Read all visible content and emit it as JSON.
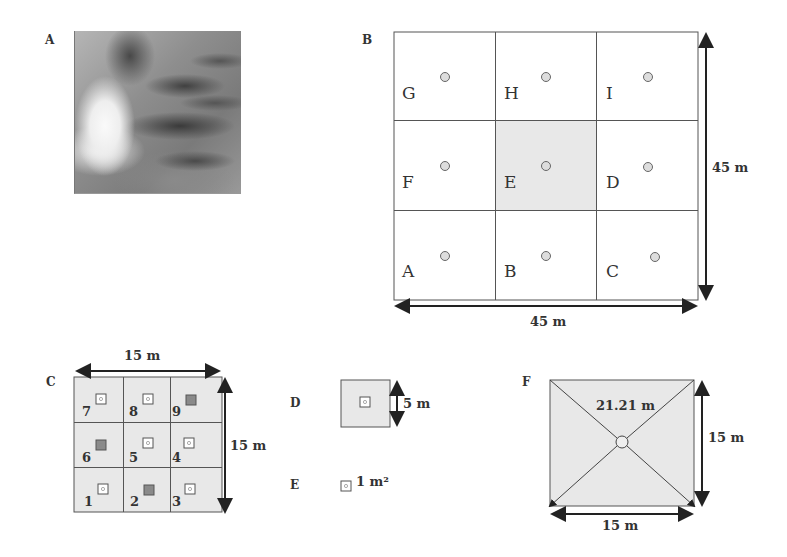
{
  "panels": {
    "A": {
      "label": "A",
      "content": "satellite-image"
    },
    "B": {
      "label": "B",
      "cells": [
        {
          "letter": "G",
          "shaded": false
        },
        {
          "letter": "H",
          "shaded": false
        },
        {
          "letter": "I",
          "shaded": false
        },
        {
          "letter": "F",
          "shaded": false
        },
        {
          "letter": "E",
          "shaded": true
        },
        {
          "letter": "D",
          "shaded": false
        },
        {
          "letter": "A",
          "shaded": false
        },
        {
          "letter": "B",
          "shaded": false
        },
        {
          "letter": "C",
          "shaded": false
        }
      ],
      "height_label": "45 m",
      "width_label": "45 m"
    },
    "C": {
      "label": "C",
      "cells": [
        {
          "number": "7",
          "dark": false
        },
        {
          "number": "8",
          "dark": false
        },
        {
          "number": "9",
          "dark": true
        },
        {
          "number": "6",
          "dark": true
        },
        {
          "number": "5",
          "dark": false
        },
        {
          "number": "4",
          "dark": false
        },
        {
          "number": "1",
          "dark": false
        },
        {
          "number": "2",
          "dark": true
        },
        {
          "number": "3",
          "dark": false
        }
      ],
      "width_label": "15 m",
      "height_label": "15 m"
    },
    "D": {
      "label": "D",
      "size_label": "5 m"
    },
    "E": {
      "label": "E",
      "size_label": "1 m²"
    },
    "F": {
      "label": "F",
      "diagonal_label": "21.21 m",
      "height_label": "15 m",
      "width_label": "15 m"
    }
  },
  "colors": {
    "line": "#555555",
    "shade": "#e6e6e6",
    "dark_quadrat": "#8a8a8a",
    "arrow": "#222222"
  }
}
